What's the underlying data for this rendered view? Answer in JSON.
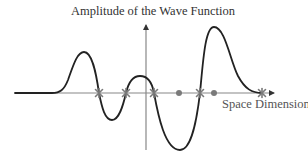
{
  "diagram": {
    "title": "Amplitude of the Wave Function",
    "x_axis_label": "Space Dimension",
    "y_axis_label": "Amplitude of the Wave Function",
    "colors": {
      "curve": "#222222",
      "axis": "#888888",
      "markers": "#7a7a7a"
    },
    "curve_description": "Oscillating wave function: flat tail, positive peak, negative trough, small positive bump, deep negative trough, tall positive peak, decaying to zero",
    "star_markers_x": [
      99,
      126,
      154,
      200,
      262
    ],
    "dot_markers_x": [
      179,
      214
    ]
  }
}
